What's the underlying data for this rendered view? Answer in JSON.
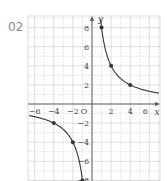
{
  "problem": {
    "number": "02"
  },
  "chart_data": {
    "type": "line",
    "title": "",
    "function": "y = 8/x",
    "xlabel": "x",
    "ylabel": "y",
    "origin_label": "O",
    "xlim": [
      -6.5,
      7
    ],
    "ylim": [
      -8.4,
      9.2
    ],
    "grid": true,
    "x_ticks": [
      -6,
      -4,
      -2,
      2,
      4,
      6
    ],
    "x_tick_labels": [
      "−6",
      "−4",
      "−2",
      "2",
      "4",
      "6"
    ],
    "y_ticks": [
      8,
      6,
      4,
      2,
      -2,
      -4,
      -6,
      -8
    ],
    "y_tick_labels": [
      "8",
      "6",
      "4",
      "2",
      "−2",
      "−4",
      "−6",
      "−8"
    ],
    "series": [
      {
        "name": "right-branch",
        "points": [
          [
            1,
            8
          ],
          [
            2,
            4
          ],
          [
            4,
            2
          ]
        ]
      },
      {
        "name": "left-branch",
        "points": [
          [
            -4,
            -2
          ],
          [
            -2,
            -4
          ],
          [
            -1,
            -8
          ]
        ]
      }
    ],
    "colors": {
      "curve": "#333333",
      "grid": "#c8c8c8",
      "axis": "#555555"
    }
  }
}
